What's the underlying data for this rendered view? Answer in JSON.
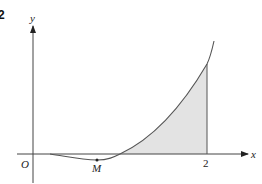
{
  "question_number": "2",
  "axes": {
    "x_label": "x",
    "y_label": "y",
    "origin_label": "O"
  },
  "points": {
    "minimum_label": "M"
  },
  "x_ticks": [
    {
      "label": "2"
    }
  ],
  "colors": {
    "curve": "#555555",
    "axis": "#444444",
    "shade": "#e3e3e3"
  }
}
